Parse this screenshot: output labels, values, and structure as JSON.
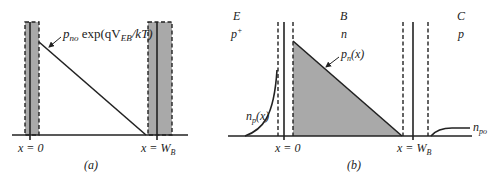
{
  "figure_a": {
    "caption": "(a)",
    "curve_label_main": "p",
    "curve_label_sub": "no",
    "curve_label_exp": " exp(qV",
    "curve_label_exp_sub": "EB",
    "curve_label_tail": "/kT)",
    "x_left_label": "x = 0",
    "x_right_label_main": "x = W",
    "x_right_label_sub": "B",
    "shade_color": "#a9a9a9"
  },
  "figure_b": {
    "caption": "(b)",
    "regions": [
      {
        "name": "E",
        "doping": "p",
        "doping_sup": "+"
      },
      {
        "name": "B",
        "doping": "n",
        "doping_sup": ""
      },
      {
        "name": "C",
        "doping": "p",
        "doping_sup": ""
      }
    ],
    "base_curve_label_main": "p",
    "base_curve_label_sub": "n",
    "base_curve_label_tail": "(x)",
    "emitter_curve_label_main": "n",
    "emitter_curve_label_sub": "p",
    "emitter_curve_label_tail": "(x)",
    "collector_level_label_main": "n",
    "collector_level_label_sub": "po",
    "x_left_label": "x = 0",
    "x_right_label_main": "x = W",
    "x_right_label_sub": "B",
    "shade_color": "#a9a9a9"
  }
}
